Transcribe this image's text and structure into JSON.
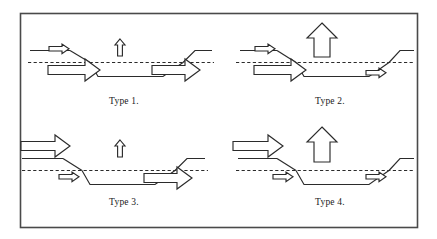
{
  "figure": {
    "background_color": "#ffffff",
    "line_color": "#2b2b2b",
    "frame_color": "#4a4a4a",
    "fill_color": "#ffffff",
    "frame": {
      "x": 20,
      "y": 13,
      "width": 398,
      "height": 215
    },
    "panels": [
      {
        "id": "type-1",
        "label": "Type 1.",
        "label_x": 124,
        "label_y": 104,
        "hanging_wall_arrow": "large-right-arrow",
        "footwall_arrow": "large-right-arrow",
        "vertical_arrow": "small-up-arrow",
        "vertical_arrow_size": "small"
      },
      {
        "id": "type-2",
        "label": "Type 2.",
        "label_x": 330,
        "label_y": 104,
        "hanging_wall_arrow": "large-right-arrow",
        "footwall_arrow": "small-right-arrow",
        "vertical_arrow": "large-up-arrow",
        "vertical_arrow_size": "large"
      },
      {
        "id": "type-3",
        "label": "Type 3.",
        "label_x": 124,
        "label_y": 205,
        "hanging_wall_arrow": "small-right-arrow",
        "footwall_arrow": "large-right-arrow",
        "vertical_arrow": "small-up-arrow",
        "vertical_arrow_size": "small"
      },
      {
        "id": "type-4",
        "label": "Type 4.",
        "label_x": 330,
        "label_y": 205,
        "hanging_wall_arrow": "small-right-arrow",
        "footwall_arrow": "small-right-arrow",
        "vertical_arrow": "large-up-arrow",
        "vertical_arrow_size": "large"
      }
    ],
    "legend_note": ""
  }
}
